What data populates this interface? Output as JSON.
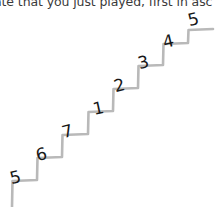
{
  "caption": {
    "text": "ate that you just played, first in asc",
    "clipped": true
  },
  "figure": {
    "name": "hand-drawn-ascending-staircase",
    "background_color": "#ffffff",
    "line_color": "#b9b9b9",
    "number_color": "#171717",
    "step_count": 8,
    "direction": "ascending-left-to-right",
    "steps": [
      {
        "label": "5",
        "x": 10,
        "y": 169,
        "rotate": -14
      },
      {
        "label": "6",
        "x": 36,
        "y": 146,
        "rotate": -14
      },
      {
        "label": "7",
        "x": 62,
        "y": 123,
        "rotate": -14
      },
      {
        "label": "1",
        "x": 91,
        "y": 100,
        "rotate": -12
      },
      {
        "label": "2",
        "x": 114,
        "y": 77,
        "rotate": -14
      },
      {
        "label": "3",
        "x": 138,
        "y": 54,
        "rotate": -14
      },
      {
        "label": "4",
        "x": 162,
        "y": 33,
        "rotate": -14
      },
      {
        "label": "5",
        "x": 187,
        "y": 12,
        "rotate": -14
      }
    ]
  }
}
